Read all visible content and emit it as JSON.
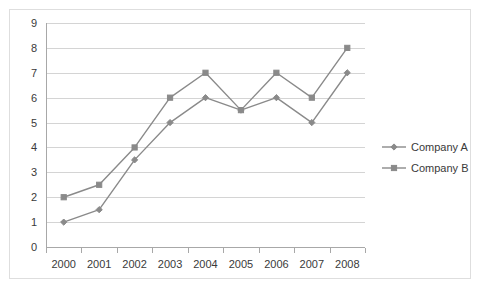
{
  "chart_data": {
    "type": "line",
    "title": "",
    "subtitle": "",
    "xlabel": "",
    "ylabel": "",
    "categories": [
      "2000",
      "2001",
      "2002",
      "2003",
      "2004",
      "2005",
      "2006",
      "2007",
      "2008"
    ],
    "series": [
      {
        "name": "Company A",
        "marker": "diamond",
        "color": "#8a8a8a",
        "values": [
          1,
          1.5,
          3.5,
          5,
          6,
          5.5,
          6,
          5,
          7
        ]
      },
      {
        "name": "Company B",
        "marker": "square",
        "color": "#8a8a8a",
        "values": [
          2,
          2.5,
          4,
          6,
          7,
          5.5,
          7,
          6,
          8
        ]
      }
    ],
    "ylim": [
      0,
      9
    ],
    "yticks": [
      "0",
      "1",
      "2",
      "3",
      "4",
      "5",
      "6",
      "7",
      "8",
      "9"
    ],
    "grid": true,
    "legend_position": "right",
    "colors": {
      "line": "#8a8a8a",
      "gridline": "#d4d4d4",
      "axis": "#a8a8a8",
      "text": "#3a3a3a",
      "border": "#dedede",
      "background": "#ffffff"
    }
  }
}
